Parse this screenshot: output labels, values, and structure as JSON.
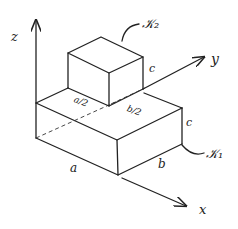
{
  "axes": {
    "x_label": "x",
    "y_label": "y",
    "z_label": "z"
  },
  "bodies": {
    "lower_label": "𝒦₁",
    "upper_label": "𝒦₂"
  },
  "dimensions": {
    "a": "a",
    "b": "b",
    "c_lower": "c",
    "c_upper": "c",
    "a_half": "a/2",
    "b_half": "b/2"
  },
  "colors": {
    "stroke": "#222222",
    "background": "#ffffff"
  }
}
